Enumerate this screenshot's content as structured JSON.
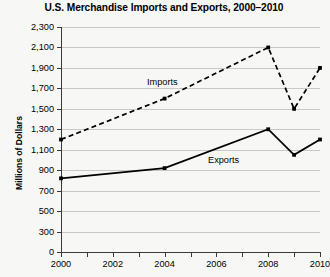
{
  "chart_data": {
    "type": "line",
    "title": "U.S. Merchandise Imports and Exports, 2000–2010",
    "xlabel": "",
    "ylabel": "Millions of Dollars",
    "x": [
      2000,
      2004,
      2008,
      2009,
      2010
    ],
    "series": [
      {
        "name": "Imports",
        "style": "dashed",
        "values": [
          1200,
          1600,
          2100,
          1500,
          1900
        ]
      },
      {
        "name": "Exports",
        "style": "solid",
        "values": [
          820,
          920,
          1300,
          1050,
          1200
        ]
      }
    ],
    "ylim": [
      0,
      2300
    ],
    "y_ticks": [
      0,
      300,
      500,
      700,
      900,
      1100,
      1300,
      1500,
      1700,
      1900,
      2100,
      2300
    ],
    "y_tick_labels": [
      "0",
      "300",
      "500",
      "700",
      "900",
      "1,100",
      "1,300",
      "1,500",
      "1,700",
      "1,900",
      "2,100",
      "2,300"
    ],
    "y_axis_broken": true,
    "x_ticks": [
      2000,
      2001,
      2002,
      2003,
      2004,
      2005,
      2006,
      2007,
      2008,
      2009,
      2010
    ],
    "x_tick_labels": [
      "2000",
      "",
      "2002",
      "",
      "2004",
      "",
      "2006",
      "",
      "2008",
      "",
      "2010"
    ],
    "xlim": [
      2000,
      2010
    ],
    "grid": true,
    "legend": "inline-labels",
    "colors": {
      "line": "#000000",
      "grid": "#c9c9c9",
      "axis": "#3b3b3b",
      "background": "#f7f7f5"
    }
  }
}
